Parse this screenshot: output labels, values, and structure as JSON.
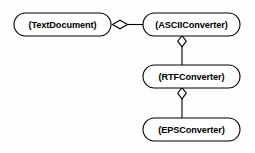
{
  "diagram": {
    "type": "uml-aggregation-diagram",
    "background_color": "#fdfdfd",
    "stroke_color": "#000000",
    "fill_color": "#ffffff",
    "nodes": [
      {
        "id": "text-document",
        "label": "(TextDocument)",
        "x": 14,
        "y": 13,
        "width": 97,
        "height": 23
      },
      {
        "id": "ascii-converter",
        "label": "(ASCIIConverter)",
        "x": 143,
        "y": 13,
        "width": 97,
        "height": 23
      },
      {
        "id": "rtf-converter",
        "label": "(RTFConverter)",
        "x": 143,
        "y": 65,
        "width": 97,
        "height": 23
      },
      {
        "id": "eps-converter",
        "label": "(EPSConverter)",
        "x": 143,
        "y": 118,
        "width": 97,
        "height": 23
      }
    ],
    "edges": [
      {
        "id": "edge-textdocument-asciiconverter",
        "from": "text-document",
        "to": "ascii-converter",
        "relation": "aggregation",
        "marker": "hollow-diamond",
        "orientation": "horizontal"
      },
      {
        "id": "edge-asciiconverter-rtfconverter",
        "from": "ascii-converter",
        "to": "rtf-converter",
        "relation": "aggregation",
        "marker": "hollow-diamond",
        "orientation": "vertical"
      },
      {
        "id": "edge-rtfconverter-epsconverter",
        "from": "rtf-converter",
        "to": "eps-converter",
        "relation": "aggregation",
        "marker": "hollow-diamond",
        "orientation": "vertical"
      }
    ]
  }
}
